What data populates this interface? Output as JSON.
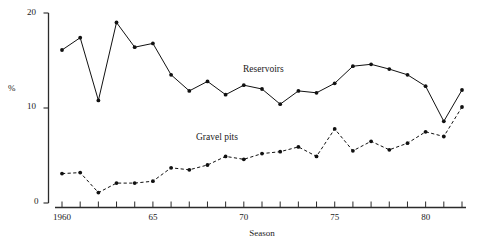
{
  "axes": {
    "y_title": "%",
    "x_title": "Season",
    "y_ticks": [
      {
        "value": 0,
        "label": "0"
      },
      {
        "value": 10,
        "label": "10"
      },
      {
        "value": 20,
        "label": "20"
      }
    ],
    "x_ticks_labeled": [
      {
        "value": 1960,
        "label": "1960"
      },
      {
        "value": 1965,
        "label": "65"
      },
      {
        "value": 1970,
        "label": "70"
      },
      {
        "value": 1975,
        "label": "75"
      },
      {
        "value": 1980,
        "label": "80"
      }
    ]
  },
  "labels": {
    "reservoirs": "Reservoirs",
    "gravel_pits": "Gravel pits"
  },
  "chart_data": {
    "type": "line",
    "title": "",
    "xlabel": "Season",
    "ylabel": "%",
    "xlim": [
      1959.4,
      1982.6
    ],
    "ylim": [
      0,
      20
    ],
    "grid": false,
    "legend": "inline-annotations",
    "x": [
      1960,
      1961,
      1962,
      1963,
      1964,
      1965,
      1966,
      1967,
      1968,
      1969,
      1970,
      1971,
      1972,
      1973,
      1974,
      1975,
      1976,
      1977,
      1978,
      1979,
      1980,
      1981,
      1982
    ],
    "series": [
      {
        "name": "Reservoirs",
        "style": "solid",
        "marker": "filled-circle",
        "color": "#111111",
        "values": [
          16.1,
          17.4,
          10.8,
          19.0,
          16.4,
          16.8,
          13.5,
          11.8,
          12.8,
          11.4,
          12.4,
          12.0,
          10.4,
          11.8,
          11.6,
          12.6,
          14.4,
          14.6,
          14.1,
          13.5,
          12.3,
          8.6,
          11.9
        ]
      },
      {
        "name": "Gravel pits",
        "style": "dashed",
        "marker": "filled-circle",
        "color": "#111111",
        "values": [
          3.1,
          3.2,
          1.1,
          2.1,
          2.1,
          2.3,
          3.7,
          3.5,
          4.0,
          4.9,
          4.6,
          5.2,
          5.4,
          5.9,
          4.9,
          7.8,
          5.5,
          6.5,
          5.6,
          6.3,
          7.5,
          7.0,
          10.1
        ]
      }
    ]
  }
}
